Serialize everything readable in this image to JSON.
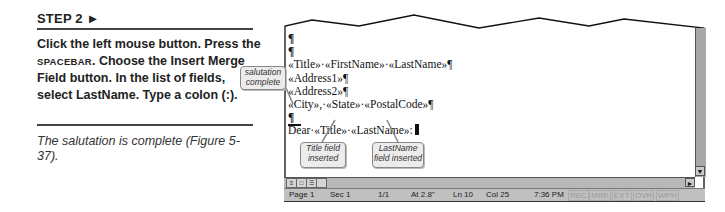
{
  "step": {
    "heading": "STEP 2 ►",
    "instruction_parts": [
      "Click the left mouse button. Press the ",
      "SPACEBAR",
      ". Choose the Insert Merge Field button. In the list of fields, select LastName. Type a colon (:)."
    ],
    "result": "The salutation is complete (Figure 5-37)."
  },
  "document": {
    "lines": [
      "¶",
      "¶",
      "«Title»·«FirstName»·«LastName»¶",
      "«Address1»¶",
      "«Address2»¶",
      "«City»,·«State»·«PostalCode»¶",
      "¶",
      "Dear·«Title»·«LastName»:"
    ]
  },
  "callouts": {
    "salutation": "salutation complete",
    "title_field": "Title field inserted",
    "lastname_field": "LastName field inserted"
  },
  "statusbar": {
    "page": "Page 1",
    "sec": "Sec 1",
    "pages": "1/1",
    "at": "At 2.8\"",
    "ln": "Ln 10",
    "col": "Col 25",
    "time": "7:36 PM",
    "rec": "REC",
    "mrk": "MRK",
    "ext": "EXT",
    "ovr": "OVR",
    "wph": "WPH"
  },
  "icons": {
    "scroll_down": "▼",
    "scroll_right": "►",
    "view_normal": "≡",
    "view_page": "□",
    "view_outline": "☰"
  }
}
